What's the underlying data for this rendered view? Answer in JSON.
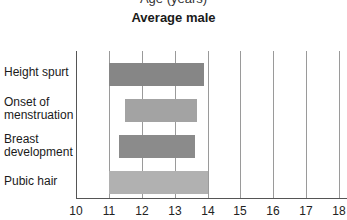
{
  "chart_data": {
    "type": "bar",
    "orientation": "horizontal-range",
    "title_partial_top": "Age (years)",
    "title": "Average male",
    "xlabel": "Age (years)",
    "ylabel": "",
    "xlim": [
      10,
      18
    ],
    "x_ticks": [
      "10",
      "11",
      "12",
      "13",
      "14",
      "15",
      "16",
      "17",
      "18"
    ],
    "grid": true,
    "categories": [
      "Height spurt",
      "Onset of menstruation",
      "Breast development",
      "Pubic hair"
    ],
    "label_lines": [
      [
        "Height spurt"
      ],
      [
        "Onset of",
        "menstruation"
      ],
      [
        "Breast",
        "development"
      ],
      [
        "Pubic hair"
      ]
    ],
    "series": [
      {
        "name": "start_age",
        "values": [
          11.0,
          11.5,
          11.3,
          11.0
        ]
      },
      {
        "name": "end_age",
        "values": [
          13.9,
          13.7,
          13.6,
          14.0
        ]
      }
    ],
    "bar_colors": [
      "#868686",
      "#a3a3a3",
      "#8b8b8b",
      "#b1b1b1"
    ],
    "legend": "none"
  },
  "header": {
    "top_cut_text": "Age (years)",
    "title": "Average male"
  },
  "labels": {
    "l0_a": "Height spurt",
    "l1_a": "Onset of",
    "l1_b": "menstruation",
    "l2_a": "Breast",
    "l2_b": "development",
    "l3_a": "Pubic hair"
  },
  "ticks": [
    "10",
    "11",
    "12",
    "13",
    "14",
    "15",
    "16",
    "17",
    "18"
  ]
}
